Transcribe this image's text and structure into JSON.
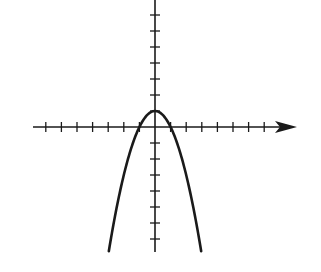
{
  "chart_data": {
    "type": "line",
    "title": "",
    "xlabel": "",
    "ylabel": "",
    "equation": "y = 1 - x^2",
    "vertex": [
      0,
      1
    ],
    "x_intercepts": [
      -1,
      1
    ],
    "xlim": [
      -7.8,
      9
    ],
    "ylim": [
      -7.8,
      8
    ],
    "x_ticks": [
      -7,
      -6,
      -5,
      -4,
      -3,
      -2,
      -1,
      1,
      2,
      3,
      4,
      5,
      6,
      7
    ],
    "y_ticks": [
      -7,
      -6,
      -5,
      -4,
      -3,
      -2,
      -1,
      1,
      2,
      3,
      4,
      5,
      6,
      7
    ],
    "tick_labels_shown": false,
    "grid": false,
    "x_axis_arrow": "right",
    "series": [
      {
        "name": "parabola",
        "x": [
          -2.96,
          -2.5,
          -2,
          -1.5,
          -1,
          -0.5,
          0,
          0.5,
          1,
          1.5,
          2,
          2.5,
          2.96
        ],
        "y": [
          -7.76,
          -5.25,
          -3,
          -1.25,
          0,
          0.75,
          1,
          0.75,
          0,
          -1.25,
          -3,
          -5.25,
          -7.76
        ]
      }
    ]
  },
  "layout": {
    "origin_px": [
      155,
      127
    ],
    "unit_px_x": 15.6,
    "unit_px_y": 16.0,
    "x_axis_start_px": 33,
    "x_axis_end_px": 297,
    "y_axis_top_px": 0,
    "y_axis_bottom_px": 252,
    "stroke_color": "#1a1a1a",
    "axis_width": 1.6,
    "curve_width": 2.6
  }
}
